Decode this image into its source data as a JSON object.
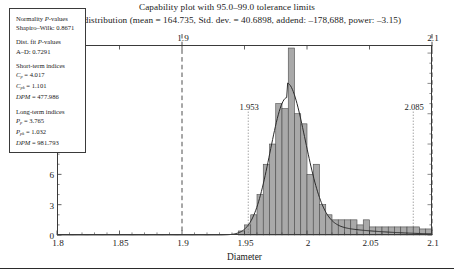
{
  "title": {
    "line1": "Capability plot with 95.0–99.0 tolerance limits",
    "line2": "Normal distribution (mean = 164.735, Std. dev. = 40.6898, addend: –178,688, power: –3.15)"
  },
  "axes": {
    "xlabel": "Diameter",
    "ylabel": "Frequency",
    "xticks": [
      "1.8",
      "1.85",
      "1.9",
      "1.95",
      "2",
      "2.05",
      "2.1"
    ],
    "yticks": [
      "0",
      "3",
      "6",
      "9",
      "12",
      "15",
      "18"
    ],
    "top_labels": [
      "1.9",
      "2.1"
    ]
  },
  "reference_lines": {
    "tolerance": [
      {
        "label": "1.9",
        "value": 1.9
      },
      {
        "label": "2.1",
        "value": 2.1
      }
    ],
    "limits": [
      {
        "label": "1.953",
        "value": 1.953
      },
      {
        "label": "2.085",
        "value": 2.085
      }
    ]
  },
  "stats_box": {
    "groups": [
      {
        "name": "normality",
        "heading": "Normality P-values",
        "lines": [
          {
            "label": "Shapiro–Wilk:",
            "value": "0.8671"
          }
        ]
      },
      {
        "name": "dist-fit",
        "heading": "Dist. fit P-values",
        "lines": [
          {
            "label": "A–D:",
            "value": "0.7291"
          }
        ]
      },
      {
        "name": "short-term",
        "heading": "Short-term indices",
        "lines": [
          {
            "label": "Cp",
            "value": "4.017"
          },
          {
            "label": "Cpk",
            "value": "1.101"
          },
          {
            "label": "DPM",
            "value": "477.986"
          }
        ]
      },
      {
        "name": "long-term",
        "heading": "Long-term indices",
        "lines": [
          {
            "label": "Pp",
            "value": "3.765"
          },
          {
            "label": "Ppk",
            "value": "1.032"
          },
          {
            "label": "DPM",
            "value": "981.793"
          }
        ]
      }
    ]
  },
  "colors": {
    "bar_fill": "#a9a9a9",
    "bar_edge": "#4a4a4a",
    "curve": "#2b2b2b",
    "axis": "#3a3a3a",
    "dashed_line": "#3a3a3a",
    "dotted_line": "#6e6e6e"
  },
  "chart_data": {
    "type": "bar",
    "title": "Capability plot with 95.0–99.0 tolerance limits",
    "subtitle": "Normal distribution (mean = 164.735, Std. dev. = 40.6898, addend: –178,688, power: –3.15)",
    "xlabel": "Diameter",
    "ylabel": "Frequency",
    "xlim": [
      1.8,
      2.1
    ],
    "ylim": [
      0,
      18.8
    ],
    "grid": false,
    "legend": "none",
    "bin_width": 0.005,
    "bin_starts": [
      1.945,
      1.95,
      1.955,
      1.96,
      1.965,
      1.97,
      1.975,
      1.98,
      1.985,
      1.99,
      1.995,
      2.0,
      2.005,
      2.01,
      2.015,
      2.02,
      2.025,
      2.03,
      2.035,
      2.04,
      2.045,
      2.05,
      2.055,
      2.06,
      2.065,
      2.07,
      2.075,
      2.08,
      2.085,
      2.09,
      2.095
    ],
    "values": [
      0.4,
      1.0,
      2.0,
      4.0,
      7.0,
      9.0,
      13.0,
      12.5,
      18.5,
      12.0,
      11.0,
      6.0,
      7.0,
      3.0,
      2.0,
      1.5,
      1.5,
      1.5,
      1.5,
      1.0,
      1.5,
      0.8,
      0.8,
      0.8,
      0.8,
      0.8,
      0.8,
      0.8,
      0.8,
      0.6,
      0.6
    ],
    "fitted_curve": {
      "name": "Fitted normal (transformed) density",
      "peak_x": 1.984,
      "peak_y": 13.6
    },
    "annotations": [
      {
        "text": "1.9",
        "x": 1.9,
        "type": "tolerance-limit",
        "line": "dashed"
      },
      {
        "text": "2.1",
        "x": 2.1,
        "type": "tolerance-limit",
        "line": "dashed"
      },
      {
        "text": "1.953",
        "x": 1.953,
        "type": "spec-limit",
        "line": "dotted"
      },
      {
        "text": "2.085",
        "x": 2.085,
        "type": "spec-limit",
        "line": "dotted"
      }
    ]
  }
}
